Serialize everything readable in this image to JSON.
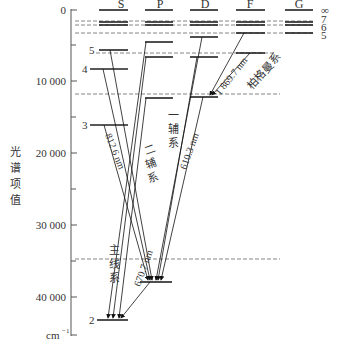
{
  "diagram": {
    "axis": {
      "label_chars": [
        "光",
        "谱",
        "项",
        "值"
      ],
      "unit": "cm",
      "unit_sup": "−1",
      "ticks": [
        {
          "label": "0",
          "y": 10
        },
        {
          "label": "10 000",
          "y": 81
        },
        {
          "label": "20 000",
          "y": 153
        },
        {
          "label": "30 000",
          "y": 225
        },
        {
          "label": "40 000",
          "y": 297
        }
      ]
    },
    "columns": [
      {
        "label": "S",
        "x": 121
      },
      {
        "label": "P",
        "x": 160
      },
      {
        "label": "D",
        "x": 205
      },
      {
        "label": "F",
        "x": 250
      },
      {
        "label": "G",
        "x": 299
      }
    ],
    "right_labels": [
      "∞",
      "7",
      "6",
      "5"
    ],
    "s_labels": [
      "5",
      "4",
      "3",
      "2"
    ],
    "transitions": {
      "principal_series_chars": [
        "主",
        "线",
        "系"
      ],
      "sharp_series_chars": [
        "二",
        "辅",
        "系"
      ],
      "diffuse_series_chars": [
        "一",
        "辅",
        "系"
      ],
      "fundamental_series": "柏格曼系",
      "wavelength_812": "812.6 nm",
      "wavelength_610": "610.3 nm",
      "wavelength_670": "670.7 nm",
      "wavelength_1869": "1 869.7 nm"
    }
  }
}
